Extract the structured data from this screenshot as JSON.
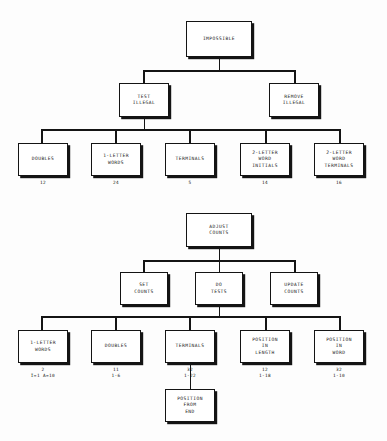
{
  "diagram": {
    "background_color": "#fdfdfd",
    "line_color": "#141414",
    "box_fill": "#ffffff",
    "trees": [
      {
        "name": "impossible-tree",
        "root": {
          "label": "IMPOSSIBLE"
        },
        "level2": [
          {
            "label": "TEST\nILLEGAL"
          },
          {
            "label": "REMOVE\nILLEGAL"
          }
        ],
        "level3": [
          {
            "label": "DOUBLES",
            "count": "12"
          },
          {
            "label": "1-LETTER\nWORDS",
            "count": "24"
          },
          {
            "label": "TERMINALS",
            "count": "5"
          },
          {
            "label": "2-LETTER\nWORD\nINITIALS",
            "count": "14"
          },
          {
            "label": "2-LETTER\nWORD\nTERMINALS",
            "count": "16"
          }
        ]
      },
      {
        "name": "adjust-counts-tree",
        "root": {
          "label": "ADJUST\nCOUNTS"
        },
        "level2": [
          {
            "label": "SET\nCOUNTS"
          },
          {
            "label": "DO\nTESTS"
          },
          {
            "label": "UPDATE\nCOUNTS"
          }
        ],
        "level3": [
          {
            "label": "1-LETTER\nWORDS",
            "count": "2",
            "range": "I=1  A=10"
          },
          {
            "label": "DOUBLES",
            "count": "11",
            "range": "1-6"
          },
          {
            "label": "TERMINALS",
            "count": "32",
            "range": "1-22"
          },
          {
            "label": "POSITION\nIN\nLENGTH",
            "count": "12",
            "range": "1-18"
          },
          {
            "label": "POSITION\nIN\nWORD",
            "count": "32",
            "range": "1-10"
          }
        ],
        "level4": [
          {
            "label": "POSITION\nFROM\nEND"
          }
        ]
      }
    ]
  }
}
